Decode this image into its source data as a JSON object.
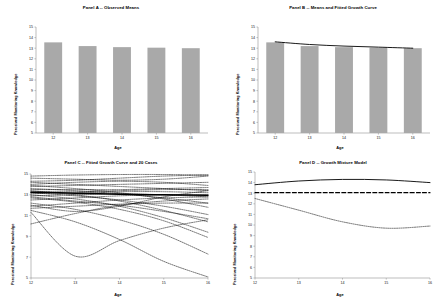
{
  "figure": {
    "background": "#ffffff",
    "bar_color": "#a9a9a9",
    "line_color": "#000000"
  },
  "axis_labels": {
    "x": "Age",
    "y": "Perceived Monitoring Knowledge"
  },
  "panels": [
    {
      "id": "panel-a",
      "title": "Panel A -- Observed Means",
      "chart_type": "bar"
    },
    {
      "id": "panel-b",
      "title": "Panel B -- Means and Fitted Growth Curve",
      "chart_type": "bar+line"
    },
    {
      "id": "panel-c",
      "title": "Panel C -- Fitted Growth Curve and 20 Cases",
      "chart_type": "line"
    },
    {
      "id": "panel-d",
      "title": "Panel D -- Growth Mixture Model",
      "chart_type": "line"
    }
  ],
  "chart_data": [
    {
      "panel": "A",
      "type": "bar",
      "title": "Panel A -- Observed Means",
      "xlabel": "Age",
      "ylabel": "Perceived Monitoring Knowledge",
      "categories": [
        12,
        13,
        14,
        15,
        16
      ],
      "tick_labels_x": [
        "12",
        "13",
        "14",
        "15",
        "16"
      ],
      "values": [
        13.55,
        13.2,
        13.1,
        13.05,
        13.0
      ],
      "ylim": [
        5,
        15
      ],
      "yticks": [
        5,
        6,
        7,
        8,
        9,
        10,
        11,
        12,
        13,
        14,
        15
      ],
      "tick_labels_y": [
        "5",
        "6",
        "7",
        "8",
        "9",
        "10",
        "11",
        "12",
        "13",
        "14",
        "15"
      ],
      "grid": false,
      "legend": "none",
      "bar_color": "#a9a9a9"
    },
    {
      "panel": "B",
      "type": "bar",
      "title": "Panel B -- Means and Fitted Growth Curve",
      "xlabel": "Age",
      "ylabel": "Perceived Monitoring Knowledge",
      "categories": [
        12,
        13,
        14,
        15,
        16
      ],
      "tick_labels_x": [
        "12",
        "13",
        "14",
        "15",
        "16"
      ],
      "ylim": [
        5,
        15
      ],
      "yticks": [
        5,
        6,
        7,
        8,
        9,
        10,
        11,
        12,
        13,
        14,
        15
      ],
      "tick_labels_y": [
        "5",
        "6",
        "7",
        "8",
        "9",
        "10",
        "11",
        "12",
        "13",
        "14",
        "15"
      ],
      "grid": false,
      "legend": "none",
      "bar_color": "#a9a9a9",
      "series": [
        {
          "name": "Observed means",
          "style": "bar",
          "values": [
            13.55,
            13.2,
            13.1,
            13.05,
            13.0
          ]
        },
        {
          "name": "Fitted growth curve",
          "style": "solid-line",
          "values": [
            13.6,
            13.35,
            13.2,
            13.1,
            13.0
          ]
        }
      ]
    },
    {
      "panel": "C",
      "type": "line",
      "title": "Panel C -- Fitted Growth Curve and 20 Cases",
      "xlabel": "Age",
      "ylabel": "Perceived Monitoring Knowledge",
      "x": [
        12,
        13,
        14,
        15,
        16
      ],
      "tick_labels_x": [
        "12",
        "13",
        "14",
        "15",
        "16"
      ],
      "ylim": [
        5,
        15
      ],
      "yticks": [
        5,
        7,
        9,
        11,
        13,
        15
      ],
      "tick_labels_y": [
        "5",
        "7",
        "9",
        "11",
        "13",
        "15"
      ],
      "grid": false,
      "legend": "none",
      "series": [
        {
          "name": "Fitted mean growth curve",
          "style": "solid-bold",
          "values": [
            13.25,
            13.15,
            13.05,
            13.0,
            12.95
          ]
        },
        {
          "name": "Case 1",
          "style": "dotted",
          "values": [
            14.8,
            14.9,
            14.95,
            14.95,
            14.9
          ]
        },
        {
          "name": "Case 2",
          "style": "dotted",
          "values": [
            14.6,
            14.5,
            14.4,
            14.5,
            14.8
          ]
        },
        {
          "name": "Case 3",
          "style": "dotted",
          "values": [
            14.3,
            14.4,
            14.6,
            14.8,
            14.9
          ]
        },
        {
          "name": "Case 4",
          "style": "dotted",
          "values": [
            14.2,
            14.0,
            13.8,
            13.6,
            13.4
          ]
        },
        {
          "name": "Case 5",
          "style": "dotted",
          "values": [
            14.0,
            14.2,
            14.3,
            14.2,
            13.9
          ]
        },
        {
          "name": "Case 6",
          "style": "dotted",
          "values": [
            13.9,
            13.6,
            13.2,
            12.6,
            11.8
          ]
        },
        {
          "name": "Case 7",
          "style": "dotted",
          "values": [
            13.8,
            13.9,
            14.0,
            14.1,
            14.2
          ]
        },
        {
          "name": "Case 8",
          "style": "dotted",
          "values": [
            13.6,
            13.4,
            13.1,
            12.7,
            12.2
          ]
        },
        {
          "name": "Case 9",
          "style": "dotted",
          "values": [
            13.5,
            13.5,
            13.5,
            13.6,
            13.7
          ]
        },
        {
          "name": "Case 10",
          "style": "dotted",
          "values": [
            13.4,
            13.0,
            12.4,
            11.5,
            10.4
          ]
        },
        {
          "name": "Case 11",
          "style": "dotted",
          "values": [
            13.3,
            13.3,
            13.4,
            13.5,
            13.5
          ]
        },
        {
          "name": "Case 12",
          "style": "dotted",
          "values": [
            13.2,
            12.9,
            12.5,
            11.9,
            11.1
          ]
        },
        {
          "name": "Case 13",
          "style": "dotted",
          "values": [
            13.1,
            13.2,
            13.3,
            13.3,
            13.2
          ]
        },
        {
          "name": "Case 14",
          "style": "dotted",
          "values": [
            13.0,
            12.6,
            11.9,
            10.8,
            9.4
          ]
        },
        {
          "name": "Case 15",
          "style": "dotted",
          "values": [
            12.9,
            13.0,
            13.1,
            13.0,
            12.8
          ]
        },
        {
          "name": "Case 16",
          "style": "dotted",
          "values": [
            12.7,
            12.3,
            11.6,
            10.5,
            8.9
          ]
        },
        {
          "name": "Case 17",
          "style": "dotted",
          "values": [
            12.5,
            12.7,
            12.9,
            13.0,
            13.0
          ]
        },
        {
          "name": "Case 18",
          "style": "dotted",
          "values": [
            12.2,
            11.6,
            10.6,
            9.2,
            7.3
          ]
        },
        {
          "name": "Case 19",
          "style": "dotted",
          "values": [
            11.9,
            12.2,
            12.5,
            12.7,
            12.8
          ]
        },
        {
          "name": "Case 20",
          "style": "dotted",
          "values": [
            11.5,
            10.4,
            8.7,
            6.6,
            5.1
          ]
        },
        {
          "name": "Case 21",
          "style": "dotted",
          "values": [
            10.2,
            11.2,
            12.0,
            12.4,
            12.6
          ]
        },
        {
          "name": "Case 22",
          "style": "dotted",
          "values": [
            11.7,
            11.9,
            12.1,
            12.2,
            12.2
          ]
        },
        {
          "name": "Case 23",
          "style": "dotted",
          "values": [
            12.0,
            11.4,
            11.9,
            12.8,
            13.4
          ]
        },
        {
          "name": "Case 24",
          "style": "dotted",
          "values": [
            11.3,
            7.1,
            8.6,
            9.8,
            10.6
          ]
        },
        {
          "name": "Case 25",
          "style": "dotted",
          "values": [
            12.8,
            12.4,
            12.0,
            11.4,
            10.7
          ]
        }
      ]
    },
    {
      "panel": "D",
      "type": "line",
      "title": "Panel D -- Growth Mixture Model",
      "xlabel": "Age",
      "ylabel": "Perceived Monitoring Knowledge",
      "x": [
        12,
        13,
        14,
        15,
        16
      ],
      "tick_labels_x": [
        "12",
        "13",
        "14",
        "15",
        "16"
      ],
      "ylim": [
        5,
        15
      ],
      "yticks": [
        5,
        6,
        7,
        8,
        9,
        10,
        11,
        12,
        13,
        14,
        15
      ],
      "tick_labels_y": [
        "5",
        "6",
        "7",
        "8",
        "9",
        "10",
        "11",
        "12",
        "13",
        "14",
        "15"
      ],
      "grid": false,
      "legend": "none",
      "series": [
        {
          "name": "Class 1",
          "style": "solid",
          "values": [
            13.8,
            14.15,
            14.3,
            14.25,
            14.0
          ]
        },
        {
          "name": "Class 2",
          "style": "dashed",
          "values": [
            13.05,
            13.05,
            13.05,
            13.05,
            13.05
          ]
        },
        {
          "name": "Class 3",
          "style": "dotted",
          "values": [
            12.5,
            11.4,
            10.3,
            9.7,
            9.9
          ]
        }
      ]
    }
  ]
}
